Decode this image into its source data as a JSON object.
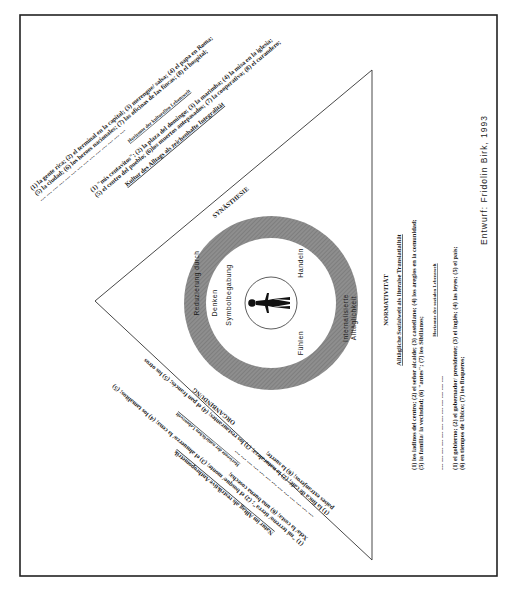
{
  "diagram": {
    "credit": "Entwurf: Fridolin Birk, 1993",
    "colors": {
      "ring": "#8c8c8c",
      "line": "#333333",
      "border": "#222222"
    },
    "center": {
      "figure": "person-icon",
      "quadrants": {
        "left": "Denken",
        "left_sub": "Symbolbegabung",
        "right_top": "Handeln",
        "right_bottom": "Fühlen"
      }
    },
    "ring": {
      "left_label": "Reduzierung durch",
      "right_label_1": "Internalisierte",
      "right_label_2": "Alltäglichkeit"
    },
    "vertices": {
      "top": "SYNÄSTHESIE",
      "right": "NORMATIVITÄT",
      "bottom": "ORGANBINDUNG"
    },
    "top_side": {
      "heading": "Kultur des Alltags als zeichenhafte Integralität",
      "inner_lines": [
        "(1) \"mis centavitos\"; (2) la plaza del domingo; (3) la marimba; (4) la misa en la iglesia;",
        "(5) el centro del pueblo; (6)los muertos antepasados; (7) la cooperativa; (8) el curandero;"
      ],
      "horizon_label": "Horizonte der kulturellen Lebenswelt",
      "dashes": "---  ---  ---  ---  ---  ---  ---  ---  ---  ---  ---  ---  ---  ---",
      "outer_lines": [
        "(1) la gente rica; (2) el terminal en la capital; (3) merengue/ salsa; (4) el papa en Roma;",
        "(5) la ciudad; (6) los heroes nacionales; (7) las oficinas de las fincas; (8) el hospital;"
      ]
    },
    "right_side": {
      "heading": "Alltägliche Sozialwelt als literalse Translatialität",
      "inner_lines": [
        "(1) los ladinos del centro; (2) el señor alcalde; (3) castellano; (4) los areglos en la comunidad;",
        "(5) la familia/ la vecindad; (6) \"antes\"; (7) los Sibilianos;"
      ],
      "horizon_label": "Horizonte der sozialen Lebenswelt",
      "dashes": "---   ---   ---   ---   ---   ---   ---   ---   ---   ---   ---   ---",
      "outer_lines": [
        "(1) el gobierno; (2) el gobernador/ presidente; (3) el inglés; (4) las leyes; (5) el país;",
        "(6) en tiempos de Ubico; (7) los finqueros;"
      ]
    },
    "bottom_side": {
      "heading": "Natur im Alltag als restriktive Anthropometrik",
      "inner_lines": [
        "(1) \"mi terreno/ tierra\"; (2) el bosque/ monte; (3) el almuerzo/ la cena; (4) los tamalitos; (5)",
        "Xela/ la costa; (6) una buena cosecha;"
      ],
      "horizon_label": "Horizonte der natürlichen Lebenswelt",
      "dashes": "---  ---  ---  ---  ---  ---  ---  ---  ---  ---  ---  ---  ---",
      "outer_lines": [
        "(1) la finca de café; (2) la naturaleza; (3) los restaurantes; (4) el pan francés; (5) los otros",
        "países extranjeros; (6) la suerte;"
      ]
    }
  }
}
